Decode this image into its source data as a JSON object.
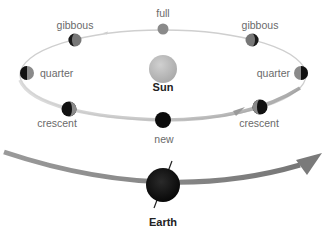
{
  "diagram": {
    "sun": {
      "label": "Sun",
      "color": "#b9b9b9"
    },
    "earth": {
      "label": "Earth",
      "color": "#111111"
    },
    "moon_phases": [
      {
        "id": "full",
        "label": "full"
      },
      {
        "id": "gibbous-left",
        "label": "gibbous"
      },
      {
        "id": "gibbous-right",
        "label": "gibbous"
      },
      {
        "id": "quarter-left",
        "label": "quarter"
      },
      {
        "id": "quarter-right",
        "label": "quarter"
      },
      {
        "id": "crescent-left",
        "label": "crescent"
      },
      {
        "id": "crescent-right",
        "label": "crescent"
      },
      {
        "id": "new",
        "label": "new"
      }
    ],
    "colors": {
      "orbit": "#c8c8c8",
      "earth_path": "#8a8a8a",
      "label": "#6a6a6a",
      "moon_dark": "#111111",
      "moon_lit": "#8c8c8c"
    }
  }
}
